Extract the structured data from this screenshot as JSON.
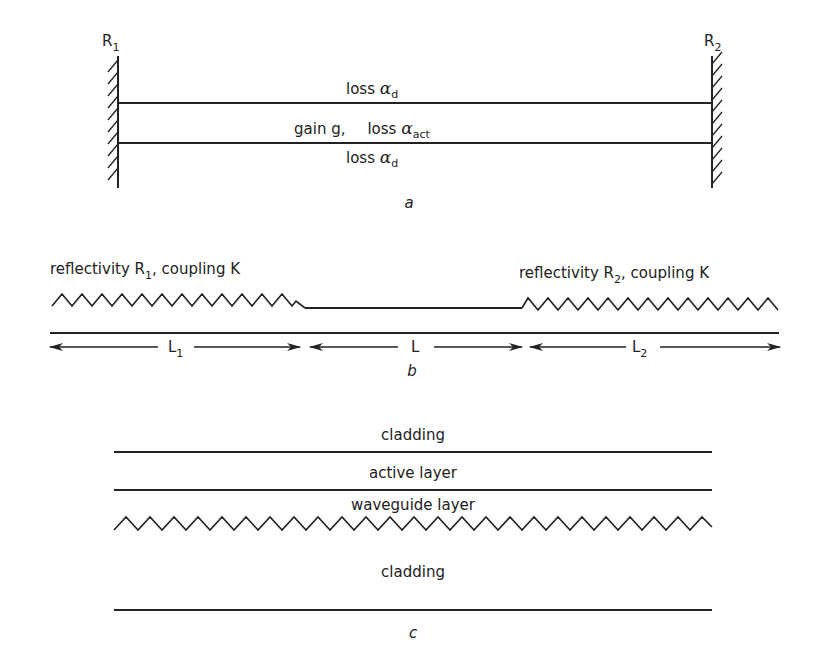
{
  "panel_a": {
    "caption": "a",
    "mirror_left": {
      "label": "R",
      "sub": "1"
    },
    "mirror_right": {
      "label": "R",
      "sub": "2"
    },
    "top_layer": {
      "text": "loss ",
      "greek": "α",
      "sub": "d"
    },
    "middle_layer": {
      "gain_text": "gain g,",
      "loss_text": "loss ",
      "greek": "α",
      "sub": "act"
    },
    "bottom_layer": {
      "text": "loss ",
      "greek": "α",
      "sub": "d"
    }
  },
  "panel_b": {
    "caption": "b",
    "left_grating": {
      "pre": "reflectivity R",
      "sub": "1",
      "post": ", coupling K"
    },
    "right_grating": {
      "pre": "reflectivity R",
      "sub": "2",
      "post": ", coupling K"
    },
    "dimensions": [
      {
        "label": "L",
        "sub": "1"
      },
      {
        "label": "L",
        "sub": ""
      },
      {
        "label": "L",
        "sub": "2"
      }
    ]
  },
  "panel_c": {
    "caption": "c",
    "layers": [
      "cladding",
      "active layer",
      "waveguide layer",
      "cladding"
    ]
  }
}
